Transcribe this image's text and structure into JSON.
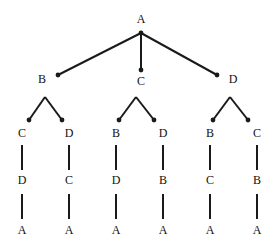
{
  "diagram": {
    "type": "tree",
    "title": "",
    "width": 278,
    "height": 251,
    "background_color": "#ffffff",
    "edge_color": "#1a1a1a",
    "node_dot_color": "#1a1a1a",
    "label_color": "#111111",
    "edge_width": 2,
    "node_dot_radius": 2.4,
    "depth": 4,
    "leaf_count": 6,
    "nodes": [
      {
        "id": "n0",
        "label": "A",
        "x": 141,
        "y": 19,
        "dot_x": 141,
        "dot_y": 33,
        "level": 0,
        "dot": true,
        "label_pos": "above"
      },
      {
        "id": "n1",
        "label": "B",
        "x": 42,
        "y": 79,
        "dot_x": 58,
        "dot_y": 75,
        "level": 1,
        "dot": true,
        "label_pos": "left"
      },
      {
        "id": "n2",
        "label": "C",
        "x": 141,
        "y": 81,
        "dot_x": 141,
        "dot_y": 70,
        "level": 1,
        "dot": true,
        "label_pos": "below"
      },
      {
        "id": "n3",
        "label": "D",
        "x": 233,
        "y": 79,
        "dot_x": 217,
        "dot_y": 75,
        "level": 1,
        "dot": true,
        "label_pos": "right"
      },
      {
        "id": "n1c1",
        "label": "C",
        "x": 22,
        "y": 133,
        "dot_x": 29,
        "dot_y": 120,
        "level": 2,
        "dot": true,
        "label_pos": "below"
      },
      {
        "id": "n1c2",
        "label": "D",
        "x": 69,
        "y": 133,
        "dot_x": 62,
        "dot_y": 120,
        "level": 2,
        "dot": true,
        "label_pos": "below"
      },
      {
        "id": "n2c1",
        "label": "B",
        "x": 116,
        "y": 133,
        "dot_x": 119,
        "dot_y": 120,
        "level": 2,
        "dot": true,
        "label_pos": "below"
      },
      {
        "id": "n2c2",
        "label": "D",
        "x": 163,
        "y": 133,
        "dot_x": 154,
        "dot_y": 120,
        "level": 2,
        "dot": true,
        "label_pos": "below"
      },
      {
        "id": "n3c1",
        "label": "B",
        "x": 210,
        "y": 133,
        "dot_x": 213,
        "dot_y": 120,
        "level": 2,
        "dot": true,
        "label_pos": "below"
      },
      {
        "id": "n3c2",
        "label": "C",
        "x": 257,
        "y": 133,
        "dot_x": 248,
        "dot_y": 120,
        "level": 2,
        "dot": true,
        "label_pos": "below"
      },
      {
        "id": "n1c1d",
        "label": "D",
        "x": 22,
        "y": 180,
        "dot_x": 22,
        "dot_y": 180,
        "level": 3,
        "dot": false,
        "label_pos": "center"
      },
      {
        "id": "n1c2d",
        "label": "C",
        "x": 69,
        "y": 180,
        "dot_x": 69,
        "dot_y": 180,
        "level": 3,
        "dot": false,
        "label_pos": "center"
      },
      {
        "id": "n2c1d",
        "label": "D",
        "x": 116,
        "y": 180,
        "dot_x": 116,
        "dot_y": 180,
        "level": 3,
        "dot": false,
        "label_pos": "center"
      },
      {
        "id": "n2c2d",
        "label": "B",
        "x": 163,
        "y": 180,
        "dot_x": 163,
        "dot_y": 180,
        "level": 3,
        "dot": false,
        "label_pos": "center"
      },
      {
        "id": "n3c1d",
        "label": "C",
        "x": 210,
        "y": 180,
        "dot_x": 210,
        "dot_y": 180,
        "level": 3,
        "dot": false,
        "label_pos": "center"
      },
      {
        "id": "n3c2d",
        "label": "B",
        "x": 257,
        "y": 180,
        "dot_x": 257,
        "dot_y": 180,
        "level": 3,
        "dot": false,
        "label_pos": "center"
      },
      {
        "id": "n1c1a",
        "label": "A",
        "x": 22,
        "y": 230,
        "dot_x": 22,
        "dot_y": 230,
        "level": 4,
        "dot": false,
        "label_pos": "center"
      },
      {
        "id": "n1c2a",
        "label": "A",
        "x": 69,
        "y": 230,
        "dot_x": 69,
        "dot_y": 230,
        "level": 4,
        "dot": false,
        "label_pos": "center"
      },
      {
        "id": "n2c1a",
        "label": "A",
        "x": 116,
        "y": 230,
        "dot_x": 116,
        "dot_y": 230,
        "level": 4,
        "dot": false,
        "label_pos": "center"
      },
      {
        "id": "n2c2a",
        "label": "A",
        "x": 163,
        "y": 230,
        "dot_x": 163,
        "dot_y": 230,
        "level": 4,
        "dot": false,
        "label_pos": "center"
      },
      {
        "id": "n3c1a",
        "label": "A",
        "x": 210,
        "y": 230,
        "dot_x": 210,
        "dot_y": 230,
        "level": 4,
        "dot": false,
        "label_pos": "center"
      },
      {
        "id": "n3c2a",
        "label": "A",
        "x": 257,
        "y": 230,
        "dot_x": 257,
        "dot_y": 230,
        "level": 4,
        "dot": false,
        "label_pos": "center"
      }
    ],
    "edges": [
      {
        "from": "n0",
        "to": "n1",
        "x1": 141,
        "y1": 33,
        "x2": 58,
        "y2": 75,
        "kind": "diagonal"
      },
      {
        "from": "n0",
        "to": "n2",
        "x1": 141,
        "y1": 33,
        "x2": 141,
        "y2": 70,
        "kind": "vertical"
      },
      {
        "from": "n0",
        "to": "n3",
        "x1": 141,
        "y1": 33,
        "x2": 217,
        "y2": 75,
        "kind": "diagonal"
      },
      {
        "from": "n1",
        "to": "n1c1",
        "x1": 45,
        "y1": 97,
        "x2": 29,
        "y2": 120,
        "kind": "diagonal"
      },
      {
        "from": "n1",
        "to": "n1c2",
        "x1": 45,
        "y1": 97,
        "x2": 62,
        "y2": 120,
        "kind": "diagonal"
      },
      {
        "from": "n2",
        "to": "n2c1",
        "x1": 136,
        "y1": 97,
        "x2": 119,
        "y2": 120,
        "kind": "diagonal"
      },
      {
        "from": "n2",
        "to": "n2c2",
        "x1": 136,
        "y1": 97,
        "x2": 154,
        "y2": 120,
        "kind": "diagonal"
      },
      {
        "from": "n3",
        "to": "n3c1",
        "x1": 230,
        "y1": 97,
        "x2": 213,
        "y2": 120,
        "kind": "diagonal"
      },
      {
        "from": "n3",
        "to": "n3c2",
        "x1": 230,
        "y1": 97,
        "x2": 248,
        "y2": 120,
        "kind": "diagonal"
      },
      {
        "from": "n1c1",
        "to": "n1c1d",
        "x1": 22,
        "y1": 145,
        "x2": 22,
        "y2": 170,
        "kind": "vertical"
      },
      {
        "from": "n1c2",
        "to": "n1c2d",
        "x1": 69,
        "y1": 145,
        "x2": 69,
        "y2": 170,
        "kind": "vertical"
      },
      {
        "from": "n2c1",
        "to": "n2c1d",
        "x1": 116,
        "y1": 145,
        "x2": 116,
        "y2": 170,
        "kind": "vertical"
      },
      {
        "from": "n2c2",
        "to": "n2c2d",
        "x1": 163,
        "y1": 145,
        "x2": 163,
        "y2": 170,
        "kind": "vertical"
      },
      {
        "from": "n3c1",
        "to": "n3c1d",
        "x1": 210,
        "y1": 145,
        "x2": 210,
        "y2": 170,
        "kind": "vertical"
      },
      {
        "from": "n3c2",
        "to": "n3c2d",
        "x1": 257,
        "y1": 145,
        "x2": 257,
        "y2": 170,
        "kind": "vertical"
      },
      {
        "from": "n1c1d",
        "to": "n1c1a",
        "x1": 22,
        "y1": 194,
        "x2": 22,
        "y2": 219,
        "kind": "vertical"
      },
      {
        "from": "n1c2d",
        "to": "n1c2a",
        "x1": 69,
        "y1": 194,
        "x2": 69,
        "y2": 219,
        "kind": "vertical"
      },
      {
        "from": "n2c1d",
        "to": "n2c1a",
        "x1": 116,
        "y1": 194,
        "x2": 116,
        "y2": 219,
        "kind": "vertical"
      },
      {
        "from": "n2c2d",
        "to": "n2c2a",
        "x1": 163,
        "y1": 194,
        "x2": 163,
        "y2": 219,
        "kind": "vertical"
      },
      {
        "from": "n3c1d",
        "to": "n3c1a",
        "x1": 210,
        "y1": 194,
        "x2": 210,
        "y2": 219,
        "kind": "vertical"
      },
      {
        "from": "n3c2d",
        "to": "n3c2a",
        "x1": 257,
        "y1": 194,
        "x2": 257,
        "y2": 219,
        "kind": "vertical"
      }
    ],
    "paths": [
      [
        "A",
        "B",
        "C",
        "D",
        "A"
      ],
      [
        "A",
        "B",
        "D",
        "C",
        "A"
      ],
      [
        "A",
        "C",
        "B",
        "D",
        "A"
      ],
      [
        "A",
        "C",
        "D",
        "B",
        "A"
      ],
      [
        "A",
        "D",
        "B",
        "C",
        "A"
      ],
      [
        "A",
        "D",
        "C",
        "B",
        "A"
      ]
    ]
  }
}
